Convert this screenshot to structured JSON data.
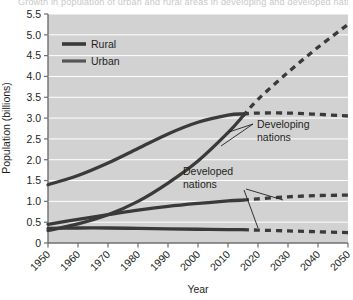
{
  "figure": {
    "cut_title": "Growth in population of urban and rural areas in developing and developed nations"
  },
  "chart_data": {
    "type": "line",
    "title": "",
    "xlabel": "Year",
    "ylabel": "Population (billions)",
    "xlim": [
      1950,
      2050
    ],
    "ylim": [
      0,
      5.5
    ],
    "grid": "horizontal",
    "legend_position": "top-left",
    "projection_start_year": 2015,
    "x": [
      1950,
      1960,
      1970,
      1980,
      1990,
      2000,
      2010,
      2015,
      2020,
      2030,
      2040,
      2050
    ],
    "xticks": [
      "1950",
      "1960",
      "1970",
      "1980",
      "1990",
      "2000",
      "2010",
      "2020",
      "2030",
      "2040",
      "2050"
    ],
    "yticks": [
      "0",
      "0.5",
      "1.0",
      "1.5",
      "2.0",
      "2.5",
      "3.0",
      "3.5",
      "4.0",
      "4.5",
      "5.0",
      "5.5"
    ],
    "legend": [
      {
        "label": "Rural",
        "style": "solid",
        "color": "#3a3a3a",
        "width": 3.4
      },
      {
        "label": "Urban",
        "style": "solid",
        "color": "#555555",
        "width": 3.0
      }
    ],
    "annotations": [
      {
        "label": "Developing nations",
        "lines": [
          "Developing",
          "nations"
        ]
      },
      {
        "label": "Developed nations",
        "lines": [
          "Developed",
          "nations"
        ]
      }
    ],
    "series": [
      {
        "name": "Developing nations - Rural",
        "group": "Developing nations",
        "type": "Rural",
        "color": "#3a3a3a",
        "values": [
          1.4,
          1.62,
          1.92,
          2.27,
          2.62,
          2.9,
          3.07,
          3.1,
          3.12,
          3.12,
          3.09,
          3.05
        ]
      },
      {
        "name": "Developing nations - Urban",
        "group": "Developing nations",
        "type": "Urban",
        "color": "#3a3a3a",
        "values": [
          0.3,
          0.46,
          0.68,
          1.0,
          1.44,
          1.97,
          2.65,
          3.05,
          3.45,
          4.1,
          4.7,
          5.25
        ]
      },
      {
        "name": "Developed nations - Urban",
        "group": "Developed nations",
        "type": "Urban",
        "color": "#3a3a3a",
        "values": [
          0.45,
          0.57,
          0.68,
          0.79,
          0.88,
          0.95,
          1.01,
          1.03,
          1.06,
          1.11,
          1.14,
          1.15
        ]
      },
      {
        "name": "Developed nations - Rural",
        "group": "Developed nations",
        "type": "Rural",
        "color": "#3a3a3a",
        "values": [
          0.35,
          0.36,
          0.36,
          0.35,
          0.34,
          0.33,
          0.32,
          0.32,
          0.31,
          0.29,
          0.27,
          0.25
        ]
      }
    ]
  }
}
